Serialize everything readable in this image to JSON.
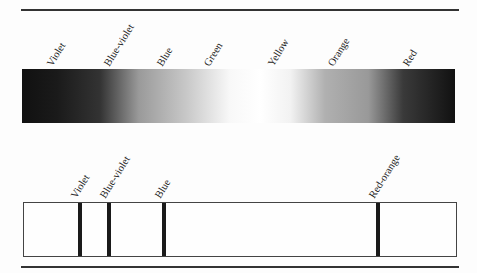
{
  "continuous_spectrum": {
    "labels": [
      {
        "text": "Violet",
        "x": 54,
        "y": 68
      },
      {
        "text": "Blue-violet",
        "x": 111,
        "y": 68
      },
      {
        "text": "Blue",
        "x": 164,
        "y": 68
      },
      {
        "text": "Green",
        "x": 211,
        "y": 68
      },
      {
        "text": "Yellow",
        "x": 275,
        "y": 68
      },
      {
        "text": "Orange",
        "x": 335,
        "y": 68
      },
      {
        "text": "Red",
        "x": 410,
        "y": 68
      }
    ],
    "gradient_colors": [
      "#111111",
      "#1a1a1a",
      "#333333",
      "#9a9a9a",
      "#c8c8c8",
      "#f8f8f8",
      "#ffffff",
      "#f2f2f2",
      "#b0b0b0",
      "#999999",
      "#3a3a3a",
      "#111111"
    ]
  },
  "line_spectrum": {
    "lines": [
      {
        "label": "Violet",
        "x": 54
      },
      {
        "label": "Blue-violet",
        "x": 83
      },
      {
        "label": "Blue",
        "x": 138
      },
      {
        "label": "Red-orange",
        "x": 352
      }
    ]
  }
}
